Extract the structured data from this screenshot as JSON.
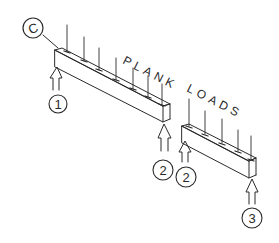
{
  "diagram": {
    "title_words": [
      "PLANK",
      "LOADS"
    ],
    "grid_bubble": {
      "label": "C"
    },
    "reactions": [
      {
        "label": "1",
        "beam": "upper-left beam, left end"
      },
      {
        "label": "2",
        "beam": "upper-left beam, right end"
      },
      {
        "label": "2",
        "beam": "lower-right beam, left end"
      },
      {
        "label": "3",
        "beam": "lower-right beam, right end"
      }
    ],
    "beams": [
      {
        "name": "beam-1-2",
        "load_arrows": 8
      },
      {
        "name": "beam-2-3",
        "load_arrows": 5
      }
    ],
    "ink_color": "#2a2a2a",
    "background": "#ffffff"
  }
}
